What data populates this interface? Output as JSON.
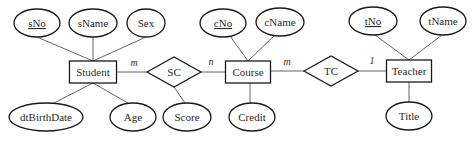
{
  "diagram": {
    "type": "er-diagram",
    "entities": [
      {
        "id": "student",
        "label": "Student",
        "x": 93,
        "y": 72,
        "w": 47,
        "h": 22
      },
      {
        "id": "course",
        "label": "Course",
        "x": 248,
        "y": 72,
        "w": 45,
        "h": 22
      },
      {
        "id": "teacher",
        "label": "Teacher",
        "x": 409,
        "y": 71,
        "w": 45,
        "h": 22
      }
    ],
    "relationships": [
      {
        "id": "sc",
        "label": "SC",
        "x": 174,
        "y": 72,
        "w": 54,
        "h": 30
      },
      {
        "id": "tc",
        "label": "TC",
        "x": 331,
        "y": 71,
        "w": 54,
        "h": 30
      }
    ],
    "attributes": [
      {
        "id": "sNo",
        "label": "sNo",
        "key": true,
        "x": 37,
        "y": 23,
        "rx": 23,
        "ry": 14,
        "of": "student"
      },
      {
        "id": "sName",
        "label": "sName",
        "key": false,
        "x": 93,
        "y": 23,
        "rx": 24,
        "ry": 14,
        "of": "student"
      },
      {
        "id": "sex",
        "label": "Sex",
        "key": false,
        "x": 146,
        "y": 23,
        "rx": 19,
        "ry": 14,
        "of": "student"
      },
      {
        "id": "dtBirthDate",
        "label": "dtBirthDate",
        "key": false,
        "x": 46,
        "y": 117,
        "rx": 37,
        "ry": 14,
        "of": "student"
      },
      {
        "id": "age",
        "label": "Age",
        "key": false,
        "x": 133,
        "y": 117,
        "rx": 23,
        "ry": 14,
        "of": "student"
      },
      {
        "id": "score",
        "label": "Score",
        "key": false,
        "x": 187,
        "y": 117,
        "rx": 24,
        "ry": 14,
        "of": "sc"
      },
      {
        "id": "cNo",
        "label": "cNo",
        "key": true,
        "x": 223,
        "y": 23,
        "rx": 23,
        "ry": 14,
        "of": "course"
      },
      {
        "id": "cName",
        "label": "cName",
        "key": false,
        "x": 280,
        "y": 22,
        "rx": 24,
        "ry": 14,
        "of": "course"
      },
      {
        "id": "credit",
        "label": "Credit",
        "key": false,
        "x": 252,
        "y": 117,
        "rx": 23,
        "ry": 14,
        "of": "course"
      },
      {
        "id": "tNo",
        "label": "tNo",
        "key": true,
        "x": 373,
        "y": 21,
        "rx": 24,
        "ry": 14,
        "of": "teacher"
      },
      {
        "id": "tName",
        "label": "tName",
        "key": false,
        "x": 443,
        "y": 21,
        "rx": 23,
        "ry": 14,
        "of": "teacher"
      },
      {
        "id": "title",
        "label": "Title",
        "key": false,
        "x": 409,
        "y": 116,
        "rx": 23,
        "ry": 14,
        "of": "teacher"
      }
    ],
    "cardinalities": [
      {
        "label": "m",
        "x": 134,
        "y": 66
      },
      {
        "label": "n",
        "x": 211,
        "y": 65
      },
      {
        "label": "m",
        "x": 287,
        "y": 65
      },
      {
        "label": "1",
        "x": 372,
        "y": 64
      }
    ]
  }
}
